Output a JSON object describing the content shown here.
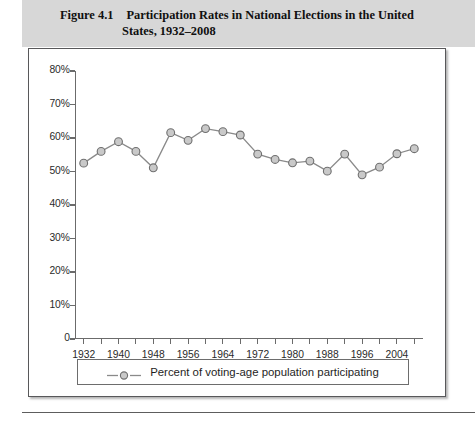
{
  "figure": {
    "number": "Figure 4.1",
    "title_line1": "Participation Rates in National Elections in the United",
    "title_line2": "States, 1932–2008",
    "header_bg": "#d7d7d7"
  },
  "legend": {
    "label": "Percent of voting-age population participating",
    "marker_icon": "line-with-circle-marker"
  },
  "chart_data": {
    "type": "line",
    "title": "Participation Rates in National Elections in the United States, 1932–2008",
    "xlabel": "",
    "ylabel": "",
    "x": [
      1932,
      1936,
      1940,
      1944,
      1948,
      1952,
      1956,
      1960,
      1964,
      1968,
      1972,
      1976,
      1980,
      1984,
      1988,
      1992,
      1996,
      2000,
      2004,
      2008
    ],
    "series": [
      {
        "name": "Percent of voting-age population participating",
        "values": [
          52.5,
          56.0,
          58.9,
          56.0,
          51.1,
          61.6,
          59.3,
          62.8,
          61.9,
          60.9,
          55.2,
          53.6,
          52.6,
          53.1,
          50.1,
          55.2,
          49.0,
          51.3,
          55.3,
          56.8
        ],
        "color": "#8a8a8a",
        "marker": "circle",
        "marker_fill": "#c9c9c9"
      }
    ],
    "ytick_values": [
      0,
      10,
      20,
      30,
      40,
      50,
      60,
      70,
      80
    ],
    "ytick_labels": [
      "0",
      "10%",
      "20%",
      "30%",
      "40%",
      "50%",
      "60%",
      "70%",
      "80%"
    ],
    "ylim": [
      0,
      80
    ],
    "xlim": [
      1930,
      2010
    ],
    "xtick_major": [
      1932,
      1940,
      1948,
      1956,
      1964,
      1972,
      1980,
      1988,
      1996,
      2004
    ],
    "xtick_major_labels": [
      "1932",
      "1940",
      "1948",
      "1956",
      "1964",
      "1972",
      "1980",
      "1988",
      "1996",
      "2004"
    ],
    "xtick_minor": [
      1936,
      1944,
      1952,
      1960,
      1968,
      1976,
      1984,
      1992,
      2000,
      2008
    ],
    "grid": false,
    "legend_position": "below-plot"
  }
}
